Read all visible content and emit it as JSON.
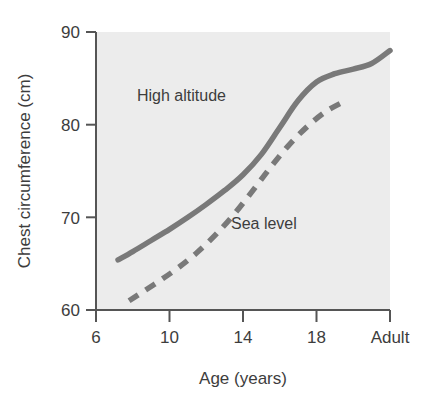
{
  "chart_data": {
    "type": "line",
    "title": "",
    "subtitle": "",
    "xlabel": "Age (years)",
    "ylabel": "Chest circumference (cm)",
    "xlim": [
      6,
      22
    ],
    "ylim": [
      60,
      90
    ],
    "xticks": [
      6,
      10,
      14,
      18,
      22
    ],
    "xtick_labels": [
      "6",
      "10",
      "14",
      "18",
      "Adult"
    ],
    "yticks": [
      60,
      70,
      80,
      90
    ],
    "ytick_labels": [
      "60",
      "70",
      "80",
      "90"
    ],
    "grid": false,
    "legend_position": "inline-annotation",
    "plot_background": "#ececec",
    "series": [
      {
        "name": "High altitude",
        "style": "solid",
        "color": "#797979",
        "x": [
          7.2,
          8,
          9,
          10,
          11,
          12,
          13,
          14,
          15,
          16,
          17,
          18,
          19,
          20,
          21,
          22
        ],
        "values": [
          65.4,
          66.3,
          67.5,
          68.7,
          70.0,
          71.4,
          72.9,
          74.6,
          76.8,
          79.7,
          82.6,
          84.6,
          85.5,
          86.0,
          86.6,
          88.0
        ]
      },
      {
        "name": "Sea level",
        "style": "dashed",
        "color": "#797979",
        "x": [
          7.8,
          8.5,
          9.5,
          10.5,
          11.5,
          12.5,
          13.5,
          14.5,
          15.5,
          16.5,
          17.5,
          18.5,
          19.5
        ],
        "values": [
          61.0,
          61.9,
          63.2,
          64.6,
          66.2,
          68.1,
          70.3,
          72.8,
          75.4,
          77.8,
          79.8,
          81.4,
          82.5
        ]
      }
    ],
    "annotations": [
      {
        "text": "High altitude",
        "x": 10.5,
        "y": 84.2
      },
      {
        "text": "Sea level",
        "x": 15.0,
        "y": 70.0
      }
    ]
  }
}
